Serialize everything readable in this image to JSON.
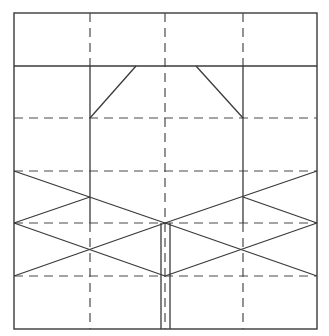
{
  "diagram": {
    "type": "fold-pattern",
    "width": 329,
    "height": 336,
    "colors": {
      "background": "#ffffff",
      "line": "#3a3a3a"
    },
    "frame": {
      "x1": 14,
      "y1": 13,
      "x2": 317,
      "y2": 329
    },
    "solid_lines": [
      {
        "name": "top-band-divider",
        "x1": 14,
        "y1": 66,
        "x2": 317,
        "y2": 66
      },
      {
        "name": "left-vertical-crease",
        "x1": 90,
        "y1": 66,
        "x2": 90,
        "y2": 223
      },
      {
        "name": "right-vertical-crease",
        "x1": 243,
        "y1": 66,
        "x2": 243,
        "y2": 223
      },
      {
        "name": "left-top-diagonal",
        "x1": 90,
        "y1": 118,
        "x2": 136,
        "y2": 66
      },
      {
        "name": "right-top-diagonal",
        "x1": 196,
        "y1": 66,
        "x2": 243,
        "y2": 118
      },
      {
        "name": "left-x-upper-a",
        "x1": 14,
        "y1": 171,
        "x2": 165,
        "y2": 223
      },
      {
        "name": "left-x-upper-b",
        "x1": 14,
        "y1": 223,
        "x2": 90,
        "y2": 197
      },
      {
        "name": "left-x-lower-a",
        "x1": 14,
        "y1": 223,
        "x2": 165,
        "y2": 276
      },
      {
        "name": "left-x-lower-b",
        "x1": 14,
        "y1": 276,
        "x2": 165,
        "y2": 223
      },
      {
        "name": "right-x-upper-a",
        "x1": 317,
        "y1": 171,
        "x2": 165,
        "y2": 223
      },
      {
        "name": "right-x-upper-b",
        "x1": 317,
        "y1": 223,
        "x2": 243,
        "y2": 197
      },
      {
        "name": "right-x-lower-a",
        "x1": 317,
        "y1": 223,
        "x2": 165,
        "y2": 276
      },
      {
        "name": "right-x-lower-b",
        "x1": 317,
        "y1": 276,
        "x2": 165,
        "y2": 223
      },
      {
        "name": "center-left-rail",
        "x1": 161,
        "y1": 223,
        "x2": 161,
        "y2": 329
      },
      {
        "name": "center-right-rail",
        "x1": 170,
        "y1": 223,
        "x2": 170,
        "y2": 329
      }
    ],
    "dashed_lines": [
      {
        "name": "left-vertical-top",
        "x1": 90,
        "y1": 13,
        "x2": 90,
        "y2": 66
      },
      {
        "name": "center-vertical",
        "x1": 165,
        "y1": 13,
        "x2": 165,
        "y2": 329
      },
      {
        "name": "right-vertical-top",
        "x1": 243,
        "y1": 13,
        "x2": 243,
        "y2": 66
      },
      {
        "name": "left-vertical-bottom",
        "x1": 90,
        "y1": 223,
        "x2": 90,
        "y2": 329
      },
      {
        "name": "right-vertical-bottom",
        "x1": 243,
        "y1": 223,
        "x2": 243,
        "y2": 329
      },
      {
        "name": "horizontal-1",
        "x1": 14,
        "y1": 118,
        "x2": 317,
        "y2": 118
      },
      {
        "name": "horizontal-2",
        "x1": 14,
        "y1": 171,
        "x2": 317,
        "y2": 171
      },
      {
        "name": "horizontal-3",
        "x1": 14,
        "y1": 223,
        "x2": 317,
        "y2": 223
      },
      {
        "name": "horizontal-4",
        "x1": 14,
        "y1": 276,
        "x2": 317,
        "y2": 276
      }
    ]
  }
}
